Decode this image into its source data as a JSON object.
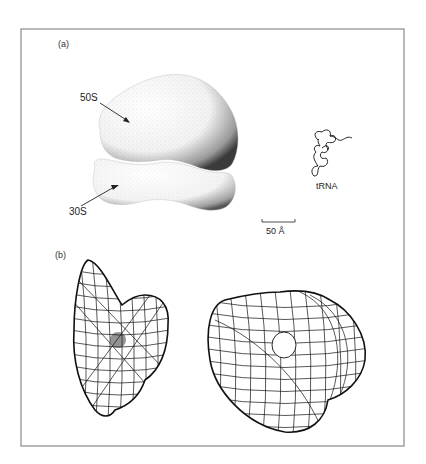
{
  "figure": {
    "panel_a": {
      "label": "(a)",
      "subunit_large_label": "50S",
      "subunit_small_label": "30S",
      "trna_label": "tRNA",
      "scale_bar_label": "50 Å"
    },
    "panel_b": {
      "label": "(b)",
      "views": [
        "wireframe-view-left",
        "wireframe-view-right"
      ]
    },
    "colors": {
      "frame": "#8a8a8a",
      "ink": "#111111",
      "background": "#ffffff"
    }
  }
}
